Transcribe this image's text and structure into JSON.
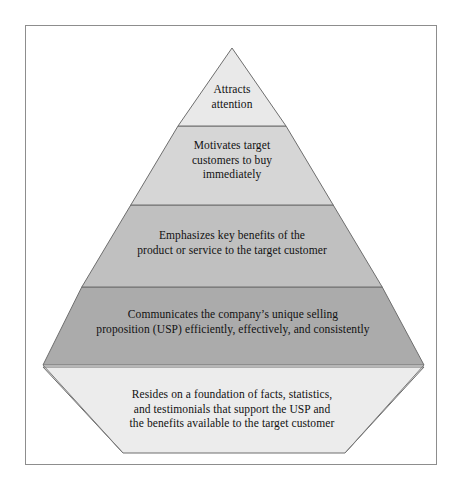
{
  "figure": {
    "background_color": "#ffffff",
    "frame_color": "#8d8d8d",
    "text_color": "#111111",
    "outline_color": "#6e6e6e"
  },
  "pyramid": {
    "apex": {
      "x": 232,
      "y": 48
    },
    "base_left": {
      "x": 43,
      "y": 365
    },
    "base_right": {
      "x": 424,
      "y": 365
    },
    "divider_y": [
      126,
      205,
      287
    ],
    "tiers": [
      {
        "id": "tier-1",
        "name": "attracts-attention",
        "text": "Attracts\nattention",
        "fill": "#e9e9e9"
      },
      {
        "id": "tier-2",
        "name": "motivates-target-customers",
        "text": "Motivates target\ncustomers to buy\nimmediately",
        "fill": "#d6d6d6"
      },
      {
        "id": "tier-3",
        "name": "emphasizes-key-benefits",
        "text": "Emphasizes key benefits of the\nproduct or service to the target customer",
        "fill": "#c0c0c0"
      },
      {
        "id": "tier-4",
        "name": "communicates-usp",
        "text": "Communicates the company’s unique selling\nproposition (USP) efficiently, effectively, and consistently",
        "fill": "#ababab"
      }
    ]
  },
  "base": {
    "id": "base-foundation",
    "name": "resides-on-foundation",
    "text": "Resides on a foundation of facts, statistics,\nand testimonials that support the USP and\nthe benefits available to the target customer",
    "fill": "#ececec",
    "top_left": {
      "x": 43,
      "y": 367
    },
    "top_right": {
      "x": 424,
      "y": 367
    },
    "bottom_right": {
      "x": 345,
      "y": 453
    },
    "bottom_left": {
      "x": 123,
      "y": 453
    }
  }
}
